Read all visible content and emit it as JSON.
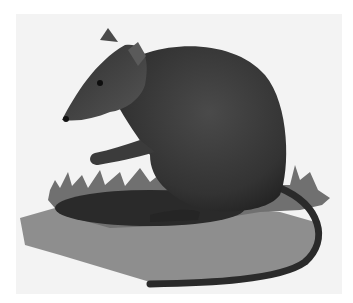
{
  "image": {
    "subject": "rodent illustration",
    "description": "Dark grey rodent sitting on grass patch with long tail curving to the right, casting a shadow",
    "colors": {
      "background": "#ffffff",
      "panel": "#f3f3f3",
      "body": "#3a3a3a",
      "body_dark": "#262626",
      "shadow": "#8a8a8a",
      "grass": "#6e6e6e"
    }
  }
}
